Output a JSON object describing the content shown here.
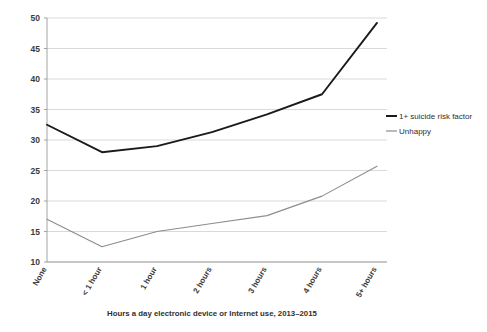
{
  "chart_data": {
    "type": "line",
    "title": "",
    "xlabel": "Hours a day electronic device or Internet use, 2013–2015",
    "ylabel": "",
    "categories": [
      "None",
      "< 1 hour",
      "1 hour",
      "2 hours",
      "3 hours",
      "4 hours",
      "5+ hours"
    ],
    "series": [
      {
        "name": "1+ suicide risk factor",
        "color": "#1a1a1a",
        "values": [
          32.5,
          28.0,
          29.0,
          31.3,
          34.2,
          37.5,
          49.2
        ]
      },
      {
        "name": "Unhappy",
        "color": "#8c8c8c",
        "values": [
          17.0,
          12.5,
          15.0,
          16.3,
          17.6,
          20.8,
          25.7
        ]
      }
    ],
    "ylim": [
      10,
      50
    ],
    "yticks": [
      10,
      15,
      20,
      25,
      30,
      35,
      40,
      45,
      50
    ],
    "ytick_labels": [
      "10",
      "15",
      "20",
      "25",
      "30",
      "35",
      "40",
      "45",
      "50"
    ],
    "grid": true,
    "grid_axis": "y",
    "legend_position": "right",
    "markers": false
  },
  "legend": {
    "items": [
      {
        "label": "1+ suicide risk factor",
        "color": "#1a1a1a"
      },
      {
        "label": "Unhappy",
        "color": "#8c8c8c"
      }
    ]
  },
  "axis": {
    "x_title": "Hours a day electronic device or Internet use, 2013–2015"
  }
}
